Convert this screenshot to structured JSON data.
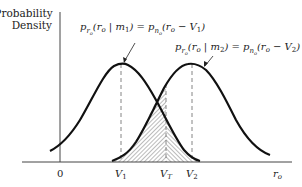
{
  "figure": {
    "y_axis_label_line1": "Probability",
    "y_axis_label_line2": "Density",
    "x_axis_label": "r",
    "x_axis_label_sub": "o",
    "origin_label": "0",
    "tick_labels": {
      "v1": "V",
      "v1_sub": "1",
      "vt": "V",
      "vt_sub": "T",
      "v2": "V",
      "v2_sub": "2"
    },
    "curve1_label": {
      "p": "p",
      "sub_r": "r",
      "sub_sub_o": "o",
      "paren_open": "(r",
      "r_sub": "o",
      "given": " | m",
      "m_sub": "1",
      "equals": ") = p",
      "sub_n": "n",
      "sub_sub_o2": "o",
      "rhs_open": "(r",
      "rhs_r_sub": "o",
      "minus": " − V",
      "v_sub": "1",
      "close": ")"
    },
    "curve2_label": {
      "p": "p",
      "sub_r": "r",
      "sub_sub_o": "o",
      "paren_open": "(r",
      "r_sub": "o",
      "given": " | m",
      "m_sub": "2",
      "equals": ") = p",
      "sub_n": "n",
      "sub_sub_o2": "o",
      "rhs_open": "(r",
      "rhs_r_sub": "o",
      "minus": " − V",
      "v_sub": "2",
      "close": ")"
    },
    "colors": {
      "curve": "#111111",
      "axis": "#444444",
      "dashed": "#777777",
      "hatch": "#555555"
    }
  }
}
